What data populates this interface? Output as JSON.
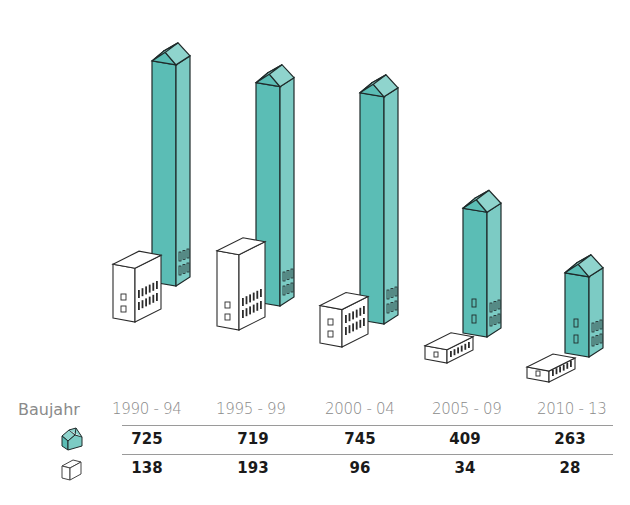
{
  "chart_data": {
    "type": "bar",
    "title": "",
    "xlabel": "Baujahr",
    "ylabel": "",
    "categories": [
      "1990 - 94",
      "1995 - 99",
      "2000 - 04",
      "2005 - 09",
      "2010 - 13"
    ],
    "series": [
      {
        "name": "Mehrfamilienhaus (tall building)",
        "icon": "teal-house-icon",
        "color": "#5bbdb5",
        "values": [
          725,
          719,
          745,
          409,
          263
        ]
      },
      {
        "name": "Einfamilienhaus (white block)",
        "icon": "white-block-icon",
        "color": "#ffffff",
        "values": [
          138,
          193,
          96,
          34,
          28
        ]
      }
    ],
    "legend_position": "left of table rows",
    "grid": false
  },
  "table": {
    "header_label": "Baujahr",
    "columns": [
      "1990 - 94",
      "1995 - 99",
      "2000 - 04",
      "2005 - 09",
      "2010 - 13"
    ],
    "row_teal": [
      "725",
      "719",
      "745",
      "409",
      "263"
    ],
    "row_white": [
      "138",
      "193",
      "96",
      "34",
      "28"
    ]
  },
  "colors": {
    "teal_front": "#5bbdb5",
    "teal_side": "#7ccbc4",
    "teal_roof": "#8fd4cd",
    "outline": "#1f2a2a",
    "text_header": "#8a8a8a",
    "text_value": "#1a1a1a"
  }
}
